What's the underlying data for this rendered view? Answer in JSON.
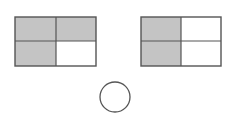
{
  "diagram": {
    "colors": {
      "shaded": "#c4c4c4",
      "unshaded": "#ffffff",
      "stroke": "#555555"
    },
    "left_grid": {
      "rows": 2,
      "cols": 2,
      "shaded_cells": [
        "top-left",
        "top-right",
        "bottom-left"
      ],
      "shaded_count": 3,
      "total_cells": 4
    },
    "right_grid": {
      "rows": 2,
      "cols": 2,
      "shaded_cells": [
        "top-left",
        "bottom-left"
      ],
      "shaded_count": 2,
      "total_cells": 4
    },
    "circle": {
      "filled": false,
      "label": ""
    }
  }
}
